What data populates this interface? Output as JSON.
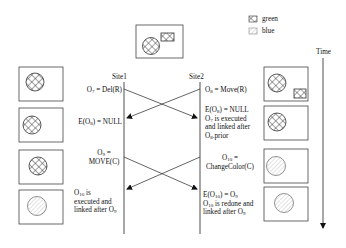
{
  "legend": {
    "items": [
      {
        "pattern": "crosshatch",
        "label": "green"
      },
      {
        "pattern": "diagonal-hatch",
        "label": "blue"
      }
    ]
  },
  "time_axis": {
    "label": "Time"
  },
  "sites": [
    {
      "label": "Site1"
    },
    {
      "label": "Site2"
    }
  ],
  "initial_state": {
    "circle": "green",
    "rect": "green"
  },
  "site1_states": [
    {
      "circle": "green",
      "rect": null
    },
    {
      "circle": "green",
      "rect": null
    },
    {
      "circle": "green",
      "rect": null
    },
    {
      "circle": "blue",
      "rect": null
    }
  ],
  "site2_states": [
    {
      "circle": "green",
      "rect": "green"
    },
    {
      "circle": "green",
      "rect": null
    },
    {
      "circle": "blue",
      "rect": null
    },
    {
      "circle": "blue",
      "rect": null
    }
  ],
  "site1_labels": {
    "o7": {
      "pre": "O",
      "sub": "7",
      "post": " = Del(R)"
    },
    "e_o8": {
      "pre": "E(O",
      "sub": "8",
      "post": ") = NULL"
    },
    "o9_line1": {
      "pre": "O",
      "sub": "9",
      "post": " ="
    },
    "o9_line2": "MOVE(C)",
    "o10_line1": {
      "pre": "O",
      "sub": "10",
      "post": "  is"
    },
    "o10_line2": "executed and",
    "o10_line3": {
      "pre": "linked after O",
      "sub": "9",
      "post": ""
    }
  },
  "site2_labels": {
    "o8": {
      "pre": "O",
      "sub": "8",
      "post": " = Move(R)"
    },
    "e_o8_line1": {
      "pre": "E(O",
      "sub": "8",
      "post": ") = NULL"
    },
    "e_o8_line2": {
      "pre": "O",
      "sub": "7",
      "post": "  is executed"
    },
    "e_o8_line3": "and linked after",
    "e_o8_line4": {
      "pre": "O",
      "sub": "8",
      "post": ".prior"
    },
    "o10_line1": {
      "pre": "O",
      "sub": "10",
      "post": " ="
    },
    "o10_line2": "ChangeColor(C)",
    "e_o10_line1": {
      "pre": "E(O",
      "sub": "10",
      "post": ") = O"
    },
    "e_o10_line1_sub2": "9",
    "e_o10_line2": {
      "pre": "O",
      "sub": "10",
      "post": " is redone and"
    },
    "e_o10_line3": {
      "pre": "linked after O",
      "sub": "9",
      "post": ""
    }
  },
  "colors": {
    "line": "#222222",
    "hatch": "#555555",
    "blue_hatch": "#9a9a9a"
  }
}
